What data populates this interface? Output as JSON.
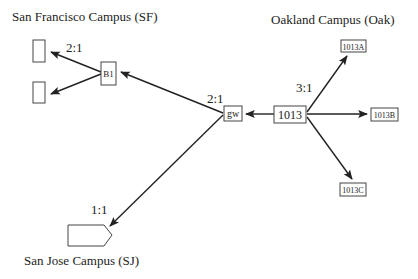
{
  "diagram": {
    "type": "network-topology",
    "groups": [
      {
        "id": "sf",
        "label": "San Francisco Campus (SF)"
      },
      {
        "id": "oak",
        "label": "Oakland Campus (Oak)"
      },
      {
        "id": "sj",
        "label": "San Jose Campus (SJ)"
      }
    ],
    "nodes": [
      {
        "id": "sf_top",
        "label": "",
        "group": "sf"
      },
      {
        "id": "sf_bottom",
        "label": "",
        "group": "sf"
      },
      {
        "id": "b1",
        "label": "B1",
        "group": "sf"
      },
      {
        "id": "gw",
        "label": "gw",
        "group": "oak"
      },
      {
        "id": "n1013",
        "label": "1013",
        "group": "oak"
      },
      {
        "id": "n1013a",
        "label": "1013A",
        "group": "oak"
      },
      {
        "id": "n1013b",
        "label": "1013B",
        "group": "oak"
      },
      {
        "id": "n1013c",
        "label": "1013C",
        "group": "oak"
      },
      {
        "id": "sj_node",
        "label": "",
        "group": "sj"
      }
    ],
    "edges": [
      {
        "from": "b1",
        "to": "sf_top"
      },
      {
        "from": "b1",
        "to": "sf_bottom"
      },
      {
        "from": "gw",
        "to": "b1"
      },
      {
        "from": "gw",
        "to": "sj_node"
      },
      {
        "from": "n1013",
        "to": "gw"
      },
      {
        "from": "n1013",
        "to": "n1013a"
      },
      {
        "from": "n1013",
        "to": "n1013b"
      },
      {
        "from": "n1013",
        "to": "n1013c"
      }
    ],
    "ratios": {
      "sf_split": "2:1",
      "gw_split": "2:1",
      "oak_split": "3:1",
      "sj_link": "1:1"
    }
  }
}
